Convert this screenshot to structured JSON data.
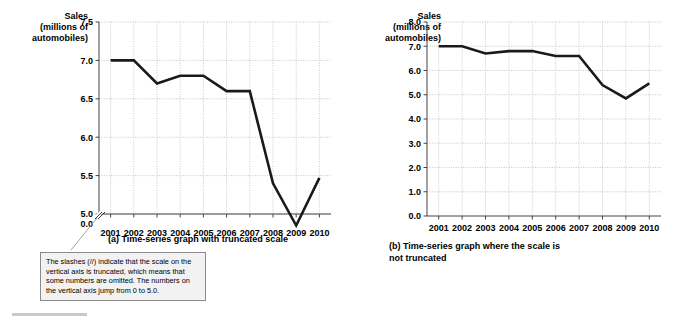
{
  "figure": {
    "bottom_rule": "horizontal-rule"
  },
  "panel_a": {
    "axis_title_lines": [
      "Sales",
      "(millions of",
      "automobiles)"
    ],
    "caption": "(a) Time-series graph with truncated scale",
    "callout": "The slashes (//) indicate that the scale on the vertical axis is truncated, which means that some numbers are omitted.  The numbers on the vertical axis jump from 0 to 5.0."
  },
  "panel_b": {
    "axis_title_lines": [
      "Sales",
      "(millions of",
      "automobiles)"
    ],
    "caption_line1": "(b) Time-series graph where the scale is",
    "caption_line2": "not truncated"
  },
  "chart_data": [
    {
      "type": "line",
      "title": "(a) Time-series graph with truncated scale",
      "xlabel": "",
      "ylabel": "Sales (millions of automobiles)",
      "x": [
        "2001",
        "2002",
        "2003",
        "2004",
        "2005",
        "2006",
        "2007",
        "2008",
        "2009",
        "2010"
      ],
      "values": [
        7.0,
        7.0,
        6.7,
        6.8,
        6.8,
        6.6,
        6.6,
        5.4,
        4.85,
        5.47
      ],
      "ylim": [
        5.0,
        7.5
      ],
      "yticks": [
        "7.5",
        "7.0",
        "6.5",
        "6.0",
        "5.5",
        "5.0",
        "0.0"
      ],
      "ytick_values": [
        7.5,
        7.0,
        6.5,
        6.0,
        5.5,
        5.0,
        0.0
      ],
      "axis_truncated": true,
      "break_symbol": "//",
      "grid": true,
      "legend": "none",
      "line_color": "#1a1a1a"
    },
    {
      "type": "line",
      "title": "(b) Time-series graph where the scale is not truncated",
      "xlabel": "",
      "ylabel": "Sales (millions of automobiles)",
      "x": [
        "2001",
        "2002",
        "2003",
        "2004",
        "2005",
        "2006",
        "2007",
        "2008",
        "2009",
        "2010"
      ],
      "values": [
        7.0,
        7.0,
        6.7,
        6.8,
        6.8,
        6.6,
        6.6,
        5.4,
        4.85,
        5.47
      ],
      "ylim": [
        0.0,
        8.0
      ],
      "yticks": [
        "8.0",
        "7.0",
        "6.0",
        "5.0",
        "4.0",
        "3.0",
        "2.0",
        "1.0",
        "0.0"
      ],
      "ytick_values": [
        8.0,
        7.0,
        6.0,
        5.0,
        4.0,
        3.0,
        2.0,
        1.0,
        0.0
      ],
      "axis_truncated": false,
      "grid": true,
      "legend": "none",
      "line_color": "#1a1a1a"
    }
  ]
}
